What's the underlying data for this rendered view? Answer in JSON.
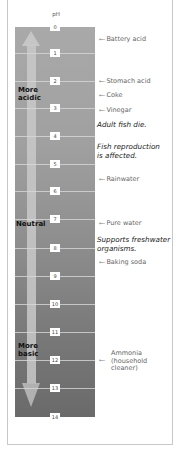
{
  "diagram": {
    "axis_label": "pH",
    "ticks": [
      {
        "value": "0",
        "y": 27
      },
      {
        "value": "1",
        "y": 53
      },
      {
        "value": "2",
        "y": 81
      },
      {
        "value": "3",
        "y": 108
      },
      {
        "value": "4",
        "y": 136
      },
      {
        "value": "5",
        "y": 164
      },
      {
        "value": "6",
        "y": 191
      },
      {
        "value": "7",
        "y": 219
      },
      {
        "value": "8",
        "y": 248
      },
      {
        "value": "9",
        "y": 276
      },
      {
        "value": "10",
        "y": 304
      },
      {
        "value": "11",
        "y": 332
      },
      {
        "value": "12",
        "y": 360
      },
      {
        "value": "13",
        "y": 388
      },
      {
        "value": "14",
        "y": 417
      }
    ],
    "regions": {
      "acidic": "More acidic",
      "neutral": "Neutral",
      "basic": "More basic"
    },
    "substances": [
      {
        "label": "Battery acid"
      },
      {
        "label": "Stomach acid"
      },
      {
        "label": "Coke"
      },
      {
        "label": "Vinegar"
      },
      {
        "label": "Rainwater"
      },
      {
        "label": "Pure water"
      },
      {
        "label": "Baking soda"
      },
      {
        "label": "Ammonia (household cleaner)",
        "lines": [
          "Ammonia",
          "(household",
          "cleaner)"
        ]
      }
    ],
    "notes": [
      {
        "text": "Adult fish die."
      },
      {
        "lines": [
          "Fish reproduction",
          "is affected."
        ]
      },
      {
        "lines": [
          "Supports freshwater",
          "organisms."
        ]
      }
    ],
    "colors": {
      "bar_top": "#a9a9a9",
      "bar_bottom": "#6a6a6a",
      "arrow": "#c9c9c9",
      "frame_border": "#c8c8c8"
    }
  }
}
